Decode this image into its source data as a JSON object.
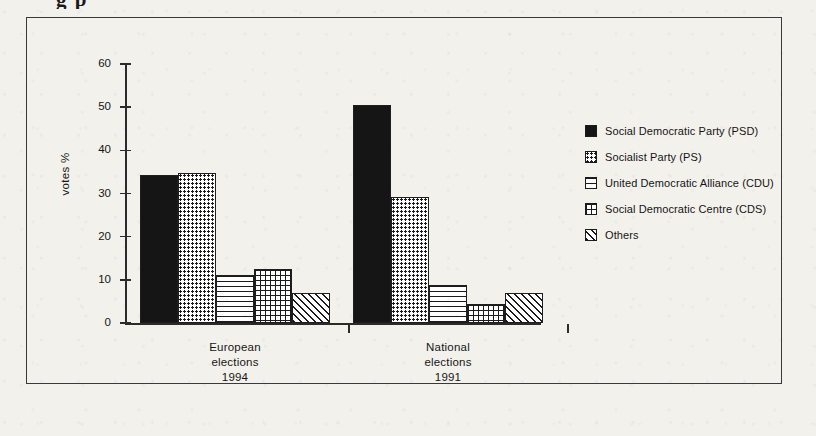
{
  "title_fragment": "g   p",
  "chart_data": {
    "type": "bar",
    "title": "",
    "xlabel": "",
    "ylabel": "votes %",
    "ylim": [
      0,
      60
    ],
    "yticks": [
      0,
      10,
      20,
      30,
      40,
      50,
      60
    ],
    "grid": false,
    "legend_position": "right",
    "categories": [
      "European\nelections\n1994",
      "National\nelections\n1991"
    ],
    "category_lines": [
      [
        "European",
        "elections",
        "1994"
      ],
      [
        "National",
        "elections",
        "1991"
      ]
    ],
    "series": [
      {
        "name": "Social Democratic Party (PSD)",
        "pattern": "solid-black",
        "values": [
          34.4,
          50.5
        ]
      },
      {
        "name": "Socialist Party (PS)",
        "pattern": "dots",
        "values": [
          34.8,
          29.1
        ]
      },
      {
        "name": "United Democratic Alliance (CDU)",
        "pattern": "horizontal-lines",
        "values": [
          11.2,
          8.8
        ]
      },
      {
        "name": "Social Democratic Centre (CDS)",
        "pattern": "cross-hatch-grid",
        "values": [
          12.4,
          4.4
        ]
      },
      {
        "name": "Others",
        "pattern": "diagonal-lines",
        "values": [
          6.9,
          6.9
        ]
      }
    ]
  },
  "legend": {
    "items": [
      {
        "label": "Social Democratic Party (PSD)",
        "pattern": "solid-black"
      },
      {
        "label": "Socialist Party (PS)",
        "pattern": "dots"
      },
      {
        "label": "United Democratic Alliance (CDU)",
        "pattern": "horizontal-lines"
      },
      {
        "label": "Social Democratic Centre (CDS)",
        "pattern": "cross-hatch-grid"
      },
      {
        "label": "Others",
        "pattern": "diagonal-lines"
      }
    ]
  },
  "axis": {
    "y_title": "votes %",
    "y_tick_labels": [
      "60",
      "50",
      "40",
      "30",
      "20",
      "10",
      "0"
    ]
  },
  "colors": {
    "ink": "#1b1b1b",
    "frame": "#3a3a3a",
    "paper": "#f3f1ec"
  }
}
